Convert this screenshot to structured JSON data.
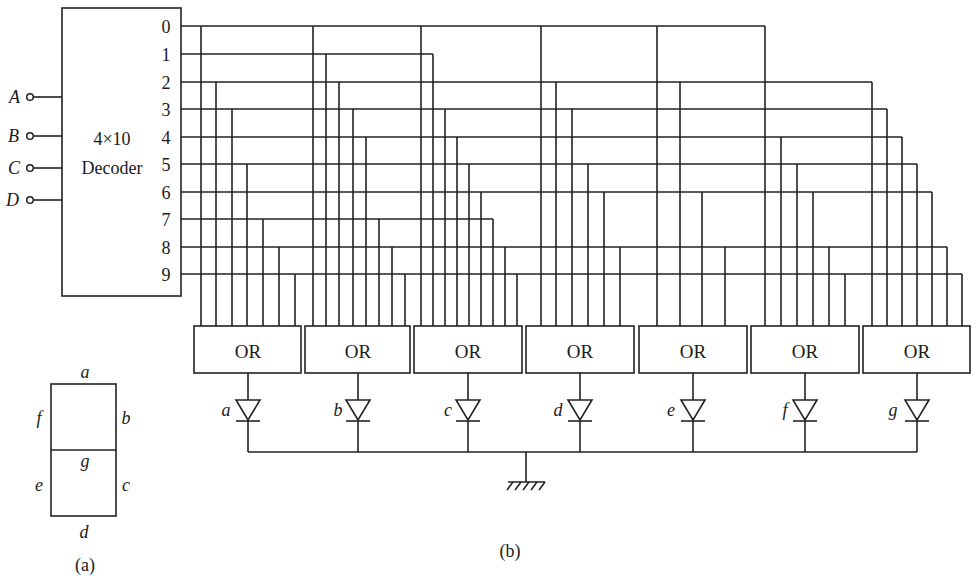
{
  "figure": {
    "caption_a": "(a)",
    "caption_b": "(b)"
  },
  "seven_segment": {
    "segments": [
      {
        "id": "a",
        "label": "a",
        "position": "top"
      },
      {
        "id": "b",
        "label": "b",
        "position": "upper-right"
      },
      {
        "id": "c",
        "label": "c",
        "position": "lower-right"
      },
      {
        "id": "d",
        "label": "d",
        "position": "bottom"
      },
      {
        "id": "e",
        "label": "e",
        "position": "lower-left"
      },
      {
        "id": "f",
        "label": "f",
        "position": "upper-left"
      },
      {
        "id": "g",
        "label": "g",
        "position": "middle"
      }
    ]
  },
  "decoder": {
    "title_line1": "4×10",
    "title_line2": "Decoder",
    "inputs": [
      "A",
      "B",
      "C",
      "D"
    ],
    "outputs": [
      "0",
      "1",
      "2",
      "3",
      "4",
      "5",
      "6",
      "7",
      "8",
      "9"
    ]
  },
  "or_gates": [
    {
      "segment": "a",
      "label": "OR",
      "inputs": [
        0,
        2,
        3,
        5,
        7,
        8,
        9
      ]
    },
    {
      "segment": "b",
      "label": "OR",
      "inputs": [
        0,
        1,
        2,
        3,
        4,
        7,
        8,
        9
      ]
    },
    {
      "segment": "c",
      "label": "OR",
      "inputs": [
        0,
        1,
        3,
        4,
        5,
        6,
        7,
        8,
        9
      ]
    },
    {
      "segment": "d",
      "label": "OR",
      "inputs": [
        0,
        2,
        3,
        5,
        6,
        8
      ]
    },
    {
      "segment": "e",
      "label": "OR",
      "inputs": [
        0,
        2,
        6,
        8
      ]
    },
    {
      "segment": "f",
      "label": "OR",
      "inputs": [
        0,
        4,
        5,
        6,
        8,
        9
      ]
    },
    {
      "segment": "g",
      "label": "OR",
      "inputs": [
        2,
        3,
        4,
        5,
        6,
        8,
        9
      ]
    }
  ],
  "diodes": [
    "a",
    "b",
    "c",
    "d",
    "e",
    "f",
    "g"
  ],
  "ground": {
    "symbol": "ground"
  },
  "colors": {
    "line": "#222222",
    "background": "#ffffff"
  }
}
